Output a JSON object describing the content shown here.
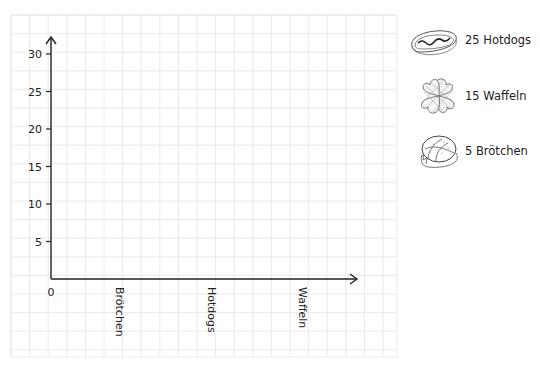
{
  "chart_data": {
    "type": "bar",
    "title": "",
    "xlabel": "",
    "ylabel": "",
    "categories": [
      "Brötchen",
      "Hotdogs",
      "Waffeln"
    ],
    "values": [
      null,
      null,
      null
    ],
    "ylim": [
      0,
      30
    ],
    "yticks": [
      0,
      5,
      10,
      15,
      20,
      25,
      30
    ],
    "ytick_labels": [
      "0",
      "5",
      "10",
      "15",
      "20",
      "25",
      "30"
    ],
    "grid": true,
    "note": "Empty axes on grid paper; bars are to be drawn. Reference quantities given in legend.",
    "legend_position": "right",
    "legend": [
      {
        "icon": "hotdog-icon",
        "count": 25,
        "label": "25 Hotdogs"
      },
      {
        "icon": "waffle-icon",
        "count": 15,
        "label": "15 Waffeln"
      },
      {
        "icon": "broetchen-icon",
        "count": 5,
        "label": "5 Brötchen"
      }
    ]
  },
  "colors": {
    "grid": "#e4e4e4",
    "axis": "#222222",
    "text": "#222222"
  }
}
